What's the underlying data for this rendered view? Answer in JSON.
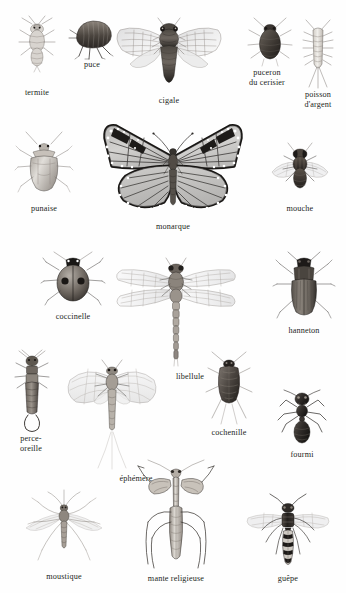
{
  "plate": {
    "title": "Insectes",
    "language": "fr",
    "background_color": "#ffffff",
    "label_color": "#231f1c",
    "rows": 5,
    "specimen_count": 19
  },
  "specimens": [
    {
      "id": "termite",
      "label": "termite",
      "row": 1,
      "x": 10,
      "y": 12,
      "w": 54,
      "h": 62,
      "label_x": 10,
      "label_y": 88,
      "label_w": 54,
      "orientation": "dorsal",
      "tone": "light"
    },
    {
      "id": "puce",
      "label": "puce",
      "row": 1,
      "x": 66,
      "y": 18,
      "w": 50,
      "h": 42,
      "label_x": 62,
      "label_y": 60,
      "label_w": 58,
      "orientation": "lateral",
      "tone": "dark"
    },
    {
      "id": "cigale",
      "label": "cigale",
      "row": 1,
      "x": 112,
      "y": 14,
      "w": 114,
      "h": 76,
      "label_x": 130,
      "label_y": 95,
      "label_w": 76,
      "orientation": "dorsal",
      "tone": "dark"
    },
    {
      "id": "puceron-du-cerisier",
      "label": "puceron\ndu cerisier",
      "row": 1,
      "x": 242,
      "y": 16,
      "w": 54,
      "h": 54,
      "label_x": 238,
      "label_y": 70,
      "label_w": 64,
      "orientation": "dorsal",
      "tone": "dark"
    },
    {
      "id": "poisson-d-argent",
      "label": "poisson\nd'argent",
      "row": 1,
      "x": 296,
      "y": 20,
      "w": 42,
      "h": 68,
      "label_x": 290,
      "label_y": 92,
      "label_w": 54,
      "orientation": "dorsal",
      "tone": "light"
    },
    {
      "id": "punaise",
      "label": "punaise",
      "row": 2,
      "x": 14,
      "y": 132,
      "w": 58,
      "h": 66,
      "label_x": 12,
      "label_y": 207,
      "label_w": 62,
      "orientation": "dorsal",
      "tone": "light"
    },
    {
      "id": "monarque",
      "label": "monarque",
      "row": 2,
      "x": 94,
      "y": 118,
      "w": 156,
      "h": 100,
      "label_x": 132,
      "label_y": 222,
      "label_w": 80,
      "orientation": "dorsal",
      "tone": "dark"
    },
    {
      "id": "mouche",
      "label": "mouche",
      "row": 2,
      "x": 268,
      "y": 142,
      "w": 62,
      "h": 56,
      "label_x": 268,
      "label_y": 205,
      "label_w": 62,
      "orientation": "dorsal",
      "tone": "dark"
    },
    {
      "id": "coccinelle",
      "label": "coccinelle",
      "row": 3,
      "x": 40,
      "y": 250,
      "w": 64,
      "h": 58,
      "label_x": 38,
      "label_y": 313,
      "label_w": 68,
      "orientation": "dorsal",
      "tone": "dark"
    },
    {
      "id": "libellule",
      "label": "libellule",
      "row": 3,
      "x": 112,
      "y": 258,
      "w": 126,
      "h": 116,
      "label_x": 142,
      "label_y": 374,
      "label_w": 66,
      "orientation": "dorsal",
      "tone": "light"
    },
    {
      "id": "hanneton",
      "label": "hanneton",
      "row": 3,
      "x": 272,
      "y": 252,
      "w": 62,
      "h": 72,
      "label_x": 270,
      "label_y": 333,
      "label_w": 66,
      "orientation": "dorsal",
      "tone": "dark"
    },
    {
      "id": "perce-oreille",
      "label": "perce-\noreille",
      "row": 4,
      "x": 12,
      "y": 350,
      "w": 38,
      "h": 82,
      "label_x": 6,
      "label_y": 434,
      "label_w": 50,
      "orientation": "dorsal",
      "tone": "mid"
    },
    {
      "id": "ephemere",
      "label": "éphémère",
      "row": 4,
      "x": 58,
      "y": 352,
      "w": 106,
      "h": 116,
      "label_x": 82,
      "label_y": 479,
      "label_w": 66,
      "orientation": "dorsal",
      "tone": "light"
    },
    {
      "id": "cochenille",
      "label": "cochenille",
      "row": 4,
      "x": 204,
      "y": 352,
      "w": 48,
      "h": 72,
      "label_x": 204,
      "label_y": 427,
      "label_w": 62,
      "orientation": "dorsal",
      "tone": "mid"
    },
    {
      "id": "fourmi",
      "label": "fourmi",
      "row": 4,
      "x": 272,
      "y": 390,
      "w": 58,
      "h": 58,
      "label_x": 272,
      "label_y": 450,
      "label_w": 58,
      "orientation": "dorsal",
      "tone": "dark"
    },
    {
      "id": "moustique",
      "label": "moustique",
      "row": 5,
      "x": 20,
      "y": 490,
      "w": 86,
      "h": 78,
      "label_x": 28,
      "label_y": 574,
      "label_w": 70,
      "orientation": "dorsal",
      "tone": "light"
    },
    {
      "id": "mante-religieuse",
      "label": "mante religieuse",
      "row": 5,
      "x": 126,
      "y": 462,
      "w": 98,
      "h": 110,
      "label_x": 128,
      "label_y": 574,
      "label_w": 96,
      "orientation": "dorsal",
      "tone": "light"
    },
    {
      "id": "guepe",
      "label": "guêpe",
      "row": 5,
      "x": 240,
      "y": 496,
      "w": 94,
      "h": 72,
      "label_x": 256,
      "label_y": 574,
      "label_w": 62,
      "orientation": "dorsal",
      "tone": "dark"
    }
  ],
  "colors": {
    "background": "#ffffff",
    "ink_dark": "#1a1715",
    "ink_mid": "#6e6862",
    "ink_light": "#b8b3ad",
    "wing_fill": "#e9e9ea",
    "label_text": "#231f1c"
  }
}
